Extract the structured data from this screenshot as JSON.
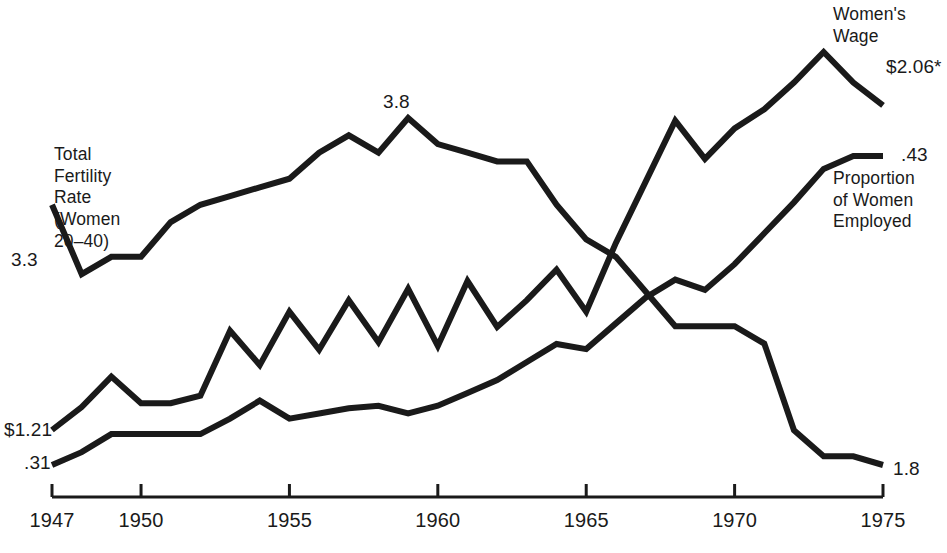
{
  "chart_data": {
    "type": "line",
    "title": "",
    "xlabel": "",
    "ylabel": "",
    "xlim": [
      1947,
      1975
    ],
    "grid": false,
    "legend": "inline-annotations",
    "x": [
      1947,
      1948,
      1949,
      1950,
      1951,
      1952,
      1953,
      1954,
      1955,
      1956,
      1957,
      1958,
      1959,
      1960,
      1961,
      1962,
      1963,
      1964,
      1965,
      1966,
      1967,
      1968,
      1969,
      1970,
      1971,
      1972,
      1973,
      1974,
      1975
    ],
    "series": [
      {
        "name": "Total Fertility Rate (Women 20-40)",
        "start_label": "3.3",
        "end_label": "1.8",
        "units": "births per woman",
        "values": [
          3.3,
          2.9,
          3.0,
          3.0,
          3.2,
          3.3,
          3.35,
          3.4,
          3.45,
          3.6,
          3.7,
          3.6,
          3.8,
          3.65,
          3.6,
          3.55,
          3.55,
          3.3,
          3.1,
          3.0,
          2.8,
          2.6,
          2.6,
          2.6,
          2.5,
          2.0,
          1.85,
          1.85,
          1.8
        ]
      },
      {
        "name": "Women's Wage",
        "start_label": "$1.21",
        "end_label": "$2.06*",
        "units": "dollars per hour",
        "values": [
          1.21,
          1.27,
          1.35,
          1.28,
          1.28,
          1.3,
          1.47,
          1.38,
          1.52,
          1.42,
          1.55,
          1.44,
          1.58,
          1.43,
          1.6,
          1.48,
          1.55,
          1.63,
          1.52,
          1.7,
          1.86,
          2.02,
          1.92,
          2.0,
          2.05,
          2.12,
          2.2,
          2.12,
          2.06
        ]
      },
      {
        "name": "Proportion of Women Employed",
        "start_label": ".31",
        "end_label": ".43",
        "units": "proportion",
        "values": [
          0.31,
          0.315,
          0.322,
          0.322,
          0.322,
          0.322,
          0.328,
          0.335,
          0.328,
          0.33,
          0.332,
          0.333,
          0.33,
          0.333,
          0.338,
          0.343,
          0.35,
          0.357,
          0.355,
          0.365,
          0.375,
          0.382,
          0.378,
          0.388,
          0.4,
          0.412,
          0.425,
          0.43,
          0.43
        ]
      }
    ]
  },
  "axis": {
    "ticks": [
      {
        "value": 1947,
        "label": "1947"
      },
      {
        "value": 1950,
        "label": "1950"
      },
      {
        "value": 1955,
        "label": "1955"
      },
      {
        "value": 1960,
        "label": "1960"
      },
      {
        "value": 1965,
        "label": "1965"
      },
      {
        "value": 1970,
        "label": "1970"
      },
      {
        "value": 1975,
        "label": "1975"
      }
    ]
  },
  "annotations": {
    "tfr_name": "Total\nFertility\nRate\n(Women\n20–40)",
    "tfr_start": "3.3",
    "tfr_peak": "3.8",
    "tfr_end": "1.8",
    "wage_name": "Women's\nWage",
    "wage_start": "$1.21",
    "wage_end": "$2.06*",
    "prop_name": "Proportion\nof Women\nEmployed",
    "prop_start": ".31",
    "prop_end": ".43"
  },
  "style": {
    "line_color": "#1a1a1a",
    "background": "#ffffff",
    "text_color": "#1a1a1a"
  }
}
